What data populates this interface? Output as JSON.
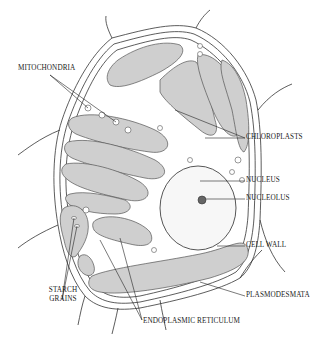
{
  "diagram": {
    "labels": {
      "mitochondria": "MITOCHONDRIA",
      "chloroplasts": "CHLOROPLASTS",
      "nucleus": "NUCLEUS",
      "nucleolus": "NUCLEOLUS",
      "cell_wall": "CELL WALL",
      "starch_grains_1": "STARCH",
      "starch_grains_2": "GRAINS",
      "plasmodesmata": "PLASMODESMATA",
      "endoplasmic_reticulum": "ENDOPLASMIC RETICULUM"
    },
    "colors": {
      "organelle_fill": "#cfcfcf",
      "nucleus_fill": "#f7f7f7",
      "line": "#333333",
      "background": "#ffffff"
    }
  }
}
